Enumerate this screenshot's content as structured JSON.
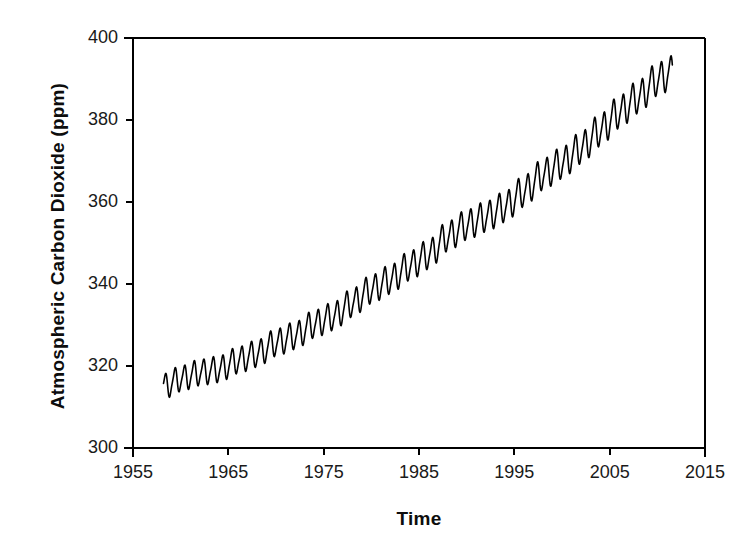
{
  "chart_data": {
    "type": "line",
    "title": "",
    "xlabel": "Time",
    "ylabel": "Atmospheric Carbon Dioxide (ppm)",
    "xlim": [
      1955,
      2015
    ],
    "ylim": [
      300,
      400
    ],
    "xticks": [
      "1955",
      "1965",
      "1975",
      "1985",
      "1995",
      "2005",
      "2015"
    ],
    "xtick_values": [
      1955,
      1965,
      1975,
      1985,
      1995,
      2005,
      2015
    ],
    "yticks": [
      "300",
      "320",
      "340",
      "360",
      "380",
      "400"
    ],
    "ytick_values": [
      300,
      320,
      340,
      360,
      380,
      400
    ],
    "grid": false,
    "legend": null,
    "line_color": "#000000",
    "line_width": 1.6,
    "background_color": "#ffffff",
    "axis_color": "#000000",
    "series": [
      {
        "name": "Monthly mean atmospheric CO2 (Mauna Loa)",
        "x_start": 1958.2,
        "x_end": 2011.6,
        "annual_cycle": true,
        "seasonal_peak_month": "May",
        "seasonal_trough_month": "October",
        "seasonal_amplitude_start_ppm": 5.8,
        "seasonal_amplitude_end_ppm": 7.6,
        "trend_points": [
          {
            "x": 1958.2,
            "y": 315.0
          },
          {
            "x": 1960.0,
            "y": 316.9
          },
          {
            "x": 1962.0,
            "y": 318.4
          },
          {
            "x": 1964.0,
            "y": 319.2
          },
          {
            "x": 1966.0,
            "y": 321.4
          },
          {
            "x": 1968.0,
            "y": 323.0
          },
          {
            "x": 1970.0,
            "y": 325.7
          },
          {
            "x": 1972.0,
            "y": 327.4
          },
          {
            "x": 1974.0,
            "y": 330.2
          },
          {
            "x": 1976.0,
            "y": 332.1
          },
          {
            "x": 1978.0,
            "y": 335.4
          },
          {
            "x": 1980.0,
            "y": 338.7
          },
          {
            "x": 1982.0,
            "y": 341.1
          },
          {
            "x": 1984.0,
            "y": 344.4
          },
          {
            "x": 1986.0,
            "y": 347.2
          },
          {
            "x": 1988.0,
            "y": 351.6
          },
          {
            "x": 1990.0,
            "y": 354.4
          },
          {
            "x": 1992.0,
            "y": 356.4
          },
          {
            "x": 1994.0,
            "y": 358.8
          },
          {
            "x": 1996.0,
            "y": 362.6
          },
          {
            "x": 1998.0,
            "y": 366.7
          },
          {
            "x": 2000.0,
            "y": 369.5
          },
          {
            "x": 2002.0,
            "y": 373.2
          },
          {
            "x": 2004.0,
            "y": 377.5
          },
          {
            "x": 2006.0,
            "y": 381.9
          },
          {
            "x": 2008.0,
            "y": 385.6
          },
          {
            "x": 2010.0,
            "y": 389.9
          },
          {
            "x": 2011.6,
            "y": 391.6
          }
        ],
        "notable_values": {
          "first_ppm": 315.0,
          "last_peak_ppm": 394.0,
          "min_ppm": 312.7,
          "max_ppm": 394.0
        }
      }
    ]
  },
  "plot_geometry": {
    "left": 133,
    "right": 705,
    "top": 38,
    "bottom": 448
  }
}
